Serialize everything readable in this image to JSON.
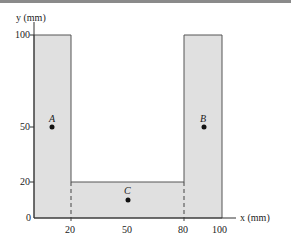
{
  "figure": {
    "y_axis_label": "y (mm)",
    "x_axis_label": "x (mm)",
    "y_ticks": [
      "100",
      "50",
      "20",
      "0"
    ],
    "x_ticks": [
      "20",
      "50",
      "80",
      "100"
    ],
    "points": [
      {
        "label": "A",
        "x": 10,
        "y": 50
      },
      {
        "label": "B",
        "x": 90,
        "y": 50
      },
      {
        "label": "C",
        "x": 50,
        "y": 10
      }
    ],
    "fill_color": "#e0e0e0",
    "stroke_color": "#555555"
  }
}
